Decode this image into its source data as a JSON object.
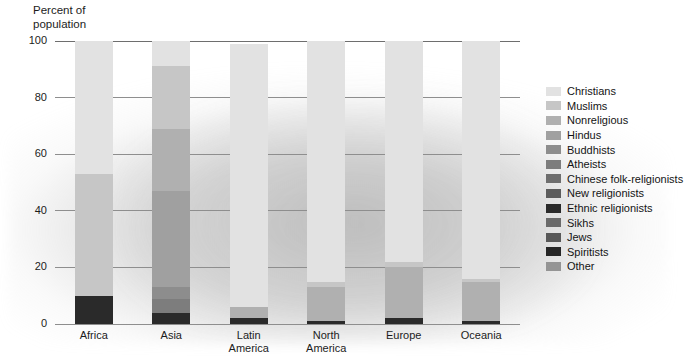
{
  "axis_title": "Percent of\npopulation",
  "legend": {
    "position": "right",
    "entries": [
      {
        "label": "Christians",
        "color": "#e2e2e2"
      },
      {
        "label": "Muslims",
        "color": "#c6c6c6"
      },
      {
        "label": "Nonreligious",
        "color": "#b0b0b0"
      },
      {
        "label": "Hindus",
        "color": "#a0a0a0"
      },
      {
        "label": "Buddhists",
        "color": "#8d8d8d"
      },
      {
        "label": "Atheists",
        "color": "#7d7d7d"
      },
      {
        "label": "Chinese folk-religionists",
        "color": "#6e6e6e"
      },
      {
        "label": "New religionists",
        "color": "#5c5c5c"
      },
      {
        "label": "Ethnic religionists",
        "color": "#2a2a2a"
      },
      {
        "label": "Sikhs",
        "color": "#6a6a6a"
      },
      {
        "label": "Jews",
        "color": "#585858"
      },
      {
        "label": "Spiritists",
        "color": "#262626"
      },
      {
        "label": "Other",
        "color": "#949494"
      }
    ]
  },
  "chart_data": {
    "type": "bar",
    "subtype": "stacked-bar",
    "title": "",
    "xlabel": "",
    "ylabel": "Percent of population",
    "ylim": [
      0,
      100
    ],
    "yticks": [
      0,
      20,
      40,
      60,
      80,
      100
    ],
    "grid": true,
    "categories": [
      "Africa",
      "Asia",
      "Latin\nAmerica",
      "North\nAmerica",
      "Europe",
      "Oceania"
    ],
    "series": [
      {
        "name": "Christians",
        "color": "#e2e2e2",
        "values": [
          47,
          9,
          93,
          85,
          78,
          84
        ]
      },
      {
        "name": "Muslims",
        "color": "#c6c6c6",
        "values": [
          43,
          22,
          0,
          2,
          2,
          1
        ]
      },
      {
        "name": "Nonreligious",
        "color": "#b0b0b0",
        "values": [
          0,
          22,
          4,
          12,
          18,
          14
        ]
      },
      {
        "name": "Hindus",
        "color": "#a0a0a0",
        "values": [
          0,
          34,
          0,
          0,
          0,
          0
        ]
      },
      {
        "name": "Buddhists",
        "color": "#8d8d8d",
        "values": [
          0,
          4,
          0,
          0,
          0,
          0
        ]
      },
      {
        "name": "Atheists",
        "color": "#7d7d7d",
        "values": [
          0,
          5,
          0,
          0,
          0,
          0
        ]
      },
      {
        "name": "Chinese folk-religionists",
        "color": "#6e6e6e",
        "values": [
          0,
          0,
          0,
          0,
          0,
          0
        ]
      },
      {
        "name": "New religionists",
        "color": "#5c5c5c",
        "values": [
          0,
          0,
          0,
          0,
          0,
          0
        ]
      },
      {
        "name": "Ethnic religionists",
        "color": "#2a2a2a",
        "values": [
          10,
          4,
          2,
          1,
          2,
          1
        ]
      }
    ]
  }
}
